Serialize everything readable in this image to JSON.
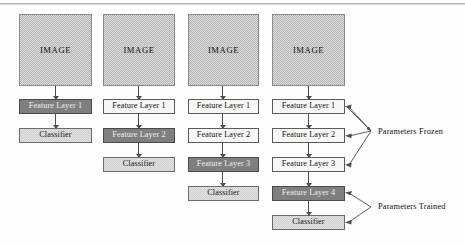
{
  "diagram": {
    "colors": {
      "image_fill": "#b4b4b4",
      "frozen_fill": "#f7f7f7",
      "trained_fill": "#7f7f7f",
      "classifier_fill": "#cfcfcf",
      "stroke": "#4d4d4d"
    },
    "columns": [
      {
        "id": "stage-1",
        "boxes": [
          {
            "label": "IMAGE",
            "style": "image"
          },
          {
            "label": "Feature Layer 1",
            "style": "dark"
          },
          {
            "label": "Classifier",
            "style": "light"
          }
        ]
      },
      {
        "id": "stage-2",
        "boxes": [
          {
            "label": "IMAGE",
            "style": "image"
          },
          {
            "label": "Feature Layer 1",
            "style": "white"
          },
          {
            "label": "Feature Layer 2",
            "style": "dark"
          },
          {
            "label": "Classifier",
            "style": "light"
          }
        ]
      },
      {
        "id": "stage-3",
        "boxes": [
          {
            "label": "IMAGE",
            "style": "image"
          },
          {
            "label": "Feature Layer 1",
            "style": "white"
          },
          {
            "label": "Feature Layer 2",
            "style": "white"
          },
          {
            "label": "Feature Layer 3",
            "style": "dark"
          },
          {
            "label": "Classifier",
            "style": "light"
          }
        ]
      },
      {
        "id": "stage-4",
        "boxes": [
          {
            "label": "IMAGE",
            "style": "image"
          },
          {
            "label": "Feature Layer 1",
            "style": "white"
          },
          {
            "label": "Feature Layer 2",
            "style": "white"
          },
          {
            "label": "Feature Layer 3",
            "style": "white"
          },
          {
            "label": "Feature Layer 4",
            "style": "dark"
          },
          {
            "label": "Classifier",
            "style": "light"
          }
        ]
      }
    ],
    "annotations": [
      {
        "id": "parameters-frozen",
        "label": "Parameters Frozen",
        "targets": [
          "Feature Layer 1",
          "Feature Layer 2",
          "Feature Layer 3"
        ]
      },
      {
        "id": "parameters-trained",
        "label": "Parameters Trained",
        "targets": [
          "Feature Layer 4",
          "Classifier"
        ]
      }
    ]
  }
}
